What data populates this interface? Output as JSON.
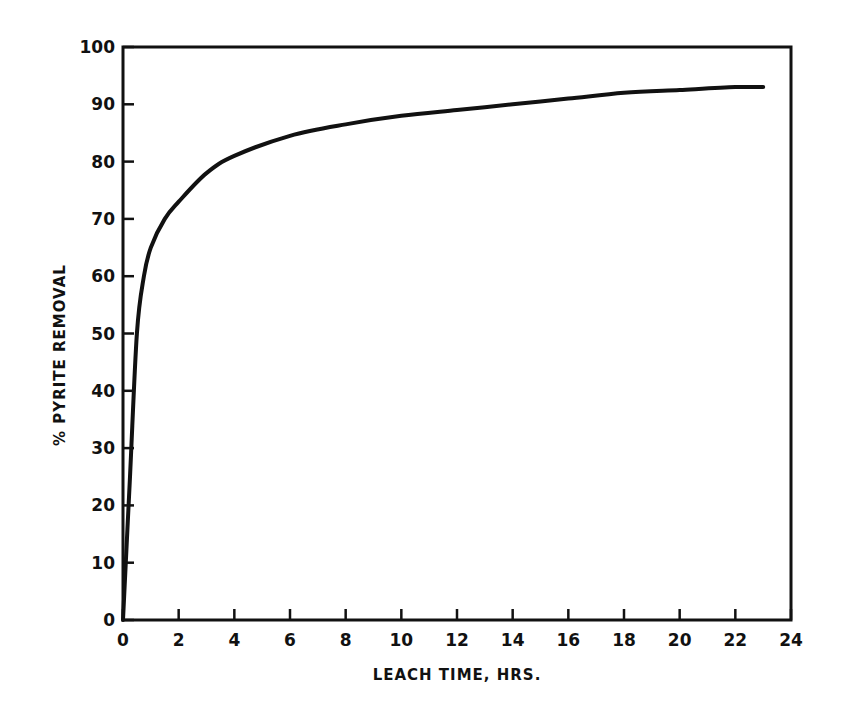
{
  "chart_data": {
    "type": "line",
    "title": "",
    "xlabel": "LEACH TIME, HRS.",
    "ylabel": "% PYRITE REMOVAL",
    "xlim": [
      0,
      24
    ],
    "ylim": [
      0,
      100
    ],
    "x_ticks": [
      0,
      2,
      4,
      6,
      8,
      10,
      12,
      14,
      16,
      18,
      20,
      22,
      24
    ],
    "y_ticks": [
      0,
      10,
      20,
      30,
      40,
      50,
      60,
      70,
      80,
      90,
      100
    ],
    "grid": false,
    "legend": null,
    "series": [
      {
        "name": "Pyrite removal",
        "x": [
          0,
          0.25,
          0.5,
          0.75,
          1,
          1.5,
          2,
          3,
          4,
          6,
          8,
          10,
          12,
          14,
          16,
          18,
          20,
          22,
          23
        ],
        "y": [
          0,
          25,
          50,
          60,
          65,
          70,
          73,
          78,
          81,
          84.5,
          86.5,
          88,
          89,
          90,
          91,
          92,
          92.5,
          93,
          93
        ]
      }
    ]
  }
}
